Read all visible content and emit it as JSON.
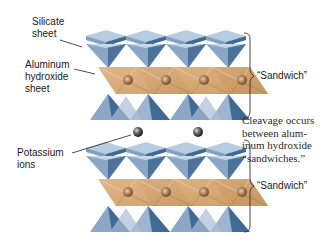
{
  "labels": {
    "silicate_sheet": "Silicate\nsheet",
    "aluminum_hydroxide_sheet": "Aluminum\nhydroxide\nsheet",
    "potassium_ions": "Potassium\nions",
    "sandwich_top": "“Sandwich”",
    "sandwich_bottom": "“Sandwich”",
    "cleavage_note": "Cleavage occurs\nbetween alum-\ninum hydroxide\n“sandwiches.”"
  },
  "colors": {
    "silicate_light": "#a9bfd6",
    "silicate_mid": "#7f9dbd",
    "silicate_dark": "#3f6a94",
    "aluminum_light": "#e2b98c",
    "aluminum_mid": "#c99863",
    "potassium": "#4a4a4a",
    "bracket": "#333333",
    "leader": "#222222"
  },
  "structure": {
    "sandwich_count": 2,
    "octahedral_cations_per_sheet": 4,
    "potassium_ion_count": 2
  }
}
